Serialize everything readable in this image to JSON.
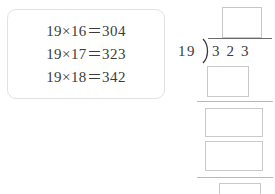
{
  "background_color": "#ffffff",
  "ink_color": "#3b3b3b",
  "box_border_color": "#c9c9c9",
  "card_border_color": "#e2e2e2",
  "hint_card": {
    "name": "multiplication-reference-card",
    "equations": [
      "19×16＝304",
      "19×17＝323",
      "19×18＝342"
    ]
  },
  "long_division": {
    "divisor": "19",
    "dividend": "323",
    "bracket_glyph": ")",
    "quotient_box": {
      "value": "",
      "placeholder": ""
    },
    "work_boxes": [
      {
        "name": "partial-product-1",
        "value": "",
        "placeholder": ""
      },
      {
        "name": "partial-remainder-1",
        "value": "",
        "placeholder": ""
      },
      {
        "name": "partial-product-2",
        "value": "",
        "placeholder": ""
      },
      {
        "name": "final-remainder",
        "value": "",
        "placeholder": ""
      }
    ]
  }
}
